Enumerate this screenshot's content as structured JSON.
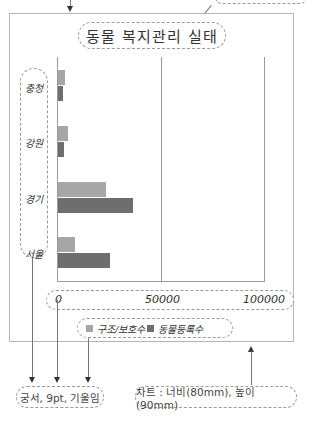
{
  "title": "동물 복지관리 실태",
  "chart_data": {
    "type": "bar",
    "orientation": "horizontal",
    "title": "동물 복지관리 실태",
    "categories": [
      "충청",
      "강원",
      "경기",
      "서울"
    ],
    "series": [
      {
        "name": "구조/보호수",
        "color": "#a6a6a6",
        "values": [
          3400,
          4700,
          23200,
          8400
        ]
      },
      {
        "name": "동물등록수",
        "color": "#6e6e6e",
        "values": [
          2600,
          3000,
          36100,
          25000
        ]
      }
    ],
    "xlabel": "",
    "ylabel": "",
    "xlim": [
      0,
      100000
    ],
    "x_ticks": [
      "0",
      "50000",
      "100000"
    ],
    "grid": true,
    "legend_position": "bottom"
  },
  "axis": {
    "ticks": [
      "0",
      "50000",
      "100000"
    ]
  },
  "legend": {
    "items": [
      {
        "label": "구조/보호수",
        "color": "#a6a6a6"
      },
      {
        "label": "동물등록수",
        "color": "#6e6e6e"
      }
    ]
  },
  "annotations": {
    "font_note": "궁서, 9pt, 기울임",
    "size_note": "차트 : 너비(80mm), 높이(90mm)"
  }
}
